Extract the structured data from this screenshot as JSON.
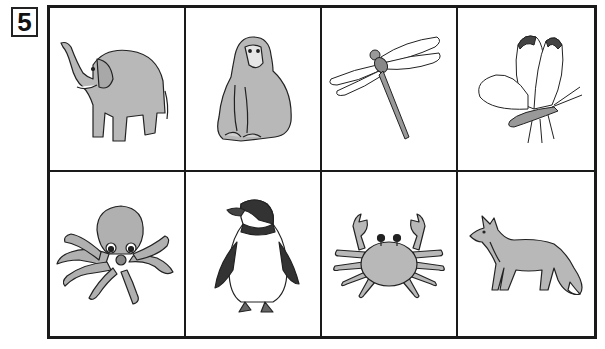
{
  "question": {
    "number": "5"
  },
  "grid": {
    "rows": 2,
    "columns": 4,
    "cells": [
      {
        "animal": "elephant",
        "icon": "elephant-icon"
      },
      {
        "animal": "monkey",
        "icon": "monkey-icon"
      },
      {
        "animal": "dragonfly",
        "icon": "dragonfly-icon"
      },
      {
        "animal": "butterfly",
        "icon": "butterfly-icon"
      },
      {
        "animal": "octopus",
        "icon": "octopus-icon"
      },
      {
        "animal": "penguin",
        "icon": "penguin-icon"
      },
      {
        "animal": "crab",
        "icon": "crab-icon"
      },
      {
        "animal": "fox",
        "icon": "fox-icon"
      }
    ]
  },
  "colors": {
    "fill": "#b8b8b8",
    "stroke": "#222222",
    "dark": "#444444"
  }
}
